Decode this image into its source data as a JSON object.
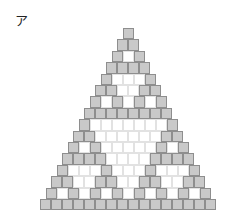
{
  "figure": {
    "label": "ア",
    "rows": 16,
    "cell_size_px": 11,
    "row_height_px": 11.4,
    "apex_center_x": 128,
    "apex_top_y": 28,
    "colors": {
      "filled": "#c9c9c9",
      "filled_border": "#8e8e8e",
      "empty": "#ffffff",
      "empty_border": "#e2e2e2"
    },
    "rule": "cell filled when binomial(row, col) is odd"
  }
}
